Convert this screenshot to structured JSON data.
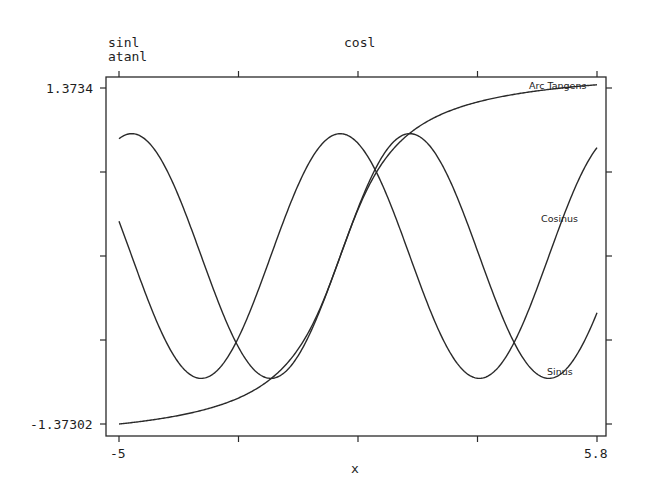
{
  "chart_data": {
    "type": "line",
    "title": "",
    "xlabel": "x",
    "ylabel": "",
    "xlim": [
      -5,
      5.8
    ],
    "ylim": [
      -1.37302,
      1.3734
    ],
    "x_tick_labels": [
      "-5",
      "5.8"
    ],
    "y_tick_labels": [
      "1.3734",
      "-1.37302"
    ],
    "top_axis_labels": {
      "left_line1": "sinl",
      "left_line2": "atanl",
      "center": "cosl"
    },
    "grid": false,
    "legend": "inline curve labels",
    "series": [
      {
        "name": "Sinus",
        "function": "sin(x)",
        "x": [
          -5,
          -4,
          -3,
          -2,
          -1,
          0,
          1,
          2,
          3,
          4,
          5,
          5.8
        ],
        "values": [
          0.959,
          0.757,
          -0.141,
          -0.909,
          -0.841,
          0.0,
          0.841,
          0.909,
          0.141,
          -0.757,
          -0.959,
          -0.465
        ]
      },
      {
        "name": "Cosinus",
        "function": "cos(x)",
        "x": [
          -5,
          -4,
          -3,
          -2,
          -1,
          0,
          1,
          2,
          3,
          4,
          5,
          5.8
        ],
        "values": [
          0.284,
          -0.654,
          -0.99,
          -0.416,
          0.54,
          1.0,
          0.54,
          -0.416,
          -0.99,
          -0.654,
          0.284,
          0.886
        ]
      },
      {
        "name": "Arc Tangens",
        "function": "atan(x)",
        "x": [
          -5,
          -4,
          -3,
          -2,
          -1,
          0,
          1,
          2,
          3,
          4,
          5,
          5.8
        ],
        "values": [
          -1.373,
          -1.326,
          -1.249,
          -1.107,
          -0.785,
          0.0,
          0.785,
          1.107,
          1.249,
          1.326,
          1.373,
          1.4
        ]
      }
    ]
  },
  "labels": {
    "top_left_1": "sinl",
    "top_left_2": "atanl",
    "top_center": "cosl",
    "y_max": "1.3734",
    "y_min": "-1.37302",
    "x_min": "-5",
    "x_max": "5.8",
    "x_axis": "x",
    "curve_sinus": "Sinus",
    "curve_cosinus": "Cosinus",
    "curve_atan": "Arc Tangens"
  },
  "colors": {
    "line": "#2a2a2a",
    "frame": "#2a2a2a",
    "background": "#ffffff"
  }
}
